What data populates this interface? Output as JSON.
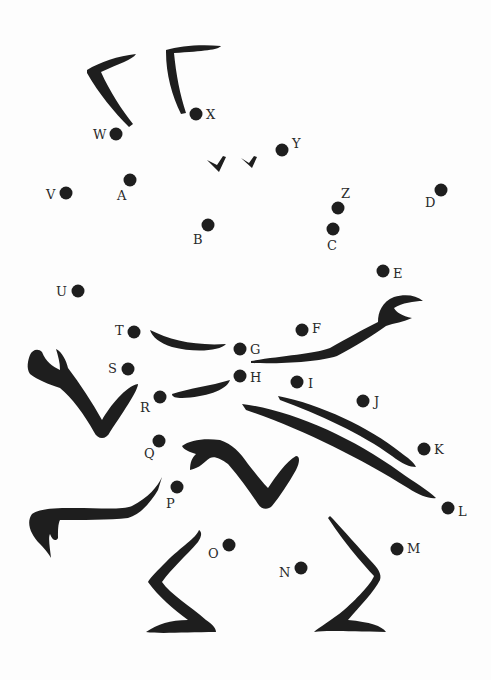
{
  "worksheet": {
    "type": "connect-the-dots",
    "ink_color": "#1e1e1e",
    "background_color": "#fdfdfd",
    "dots": [
      {
        "label": "A",
        "x": 130,
        "y": 180,
        "lx": 117,
        "ly": 200
      },
      {
        "label": "B",
        "x": 208,
        "y": 225,
        "lx": 193,
        "ly": 244
      },
      {
        "label": "C",
        "x": 333,
        "y": 229,
        "lx": 327,
        "ly": 250
      },
      {
        "label": "D",
        "x": 441,
        "y": 190,
        "lx": 425,
        "ly": 207
      },
      {
        "label": "E",
        "x": 383,
        "y": 271,
        "lx": 393,
        "ly": 278
      },
      {
        "label": "F",
        "x": 302,
        "y": 330,
        "lx": 312,
        "ly": 333
      },
      {
        "label": "G",
        "x": 240,
        "y": 349,
        "lx": 250,
        "ly": 354
      },
      {
        "label": "H",
        "x": 240,
        "y": 376,
        "lx": 250,
        "ly": 382
      },
      {
        "label": "I",
        "x": 297,
        "y": 382,
        "lx": 308,
        "ly": 388
      },
      {
        "label": "J",
        "x": 363,
        "y": 401,
        "lx": 374,
        "ly": 406
      },
      {
        "label": "K",
        "x": 424,
        "y": 449,
        "lx": 434,
        "ly": 454
      },
      {
        "label": "L",
        "x": 448,
        "y": 508,
        "lx": 458,
        "ly": 516
      },
      {
        "label": "M",
        "x": 397,
        "y": 549,
        "lx": 407,
        "ly": 553
      },
      {
        "label": "N",
        "x": 301,
        "y": 568,
        "lx": 279,
        "ly": 577
      },
      {
        "label": "O",
        "x": 229,
        "y": 545,
        "lx": 208,
        "ly": 558
      },
      {
        "label": "P",
        "x": 177,
        "y": 487,
        "lx": 166,
        "ly": 508
      },
      {
        "label": "Q",
        "x": 159,
        "y": 441,
        "lx": 144,
        "ly": 458
      },
      {
        "label": "R",
        "x": 160,
        "y": 397,
        "lx": 140,
        "ly": 412
      },
      {
        "label": "S",
        "x": 128,
        "y": 369,
        "lx": 108,
        "ly": 373
      },
      {
        "label": "T",
        "x": 134,
        "y": 332,
        "lx": 115,
        "ly": 335
      },
      {
        "label": "U",
        "x": 78,
        "y": 291,
        "lx": 56,
        "ly": 296
      },
      {
        "label": "V",
        "x": 66,
        "y": 193,
        "lx": 46,
        "ly": 199
      },
      {
        "label": "W",
        "x": 116,
        "y": 134,
        "lx": 93,
        "ly": 139
      },
      {
        "label": "X",
        "x": 196,
        "y": 114,
        "lx": 206,
        "ly": 119
      },
      {
        "label": "Y",
        "x": 282,
        "y": 150,
        "lx": 292,
        "ly": 148
      },
      {
        "label": "Z",
        "x": 338,
        "y": 208,
        "lx": 341,
        "ly": 198
      }
    ]
  }
}
